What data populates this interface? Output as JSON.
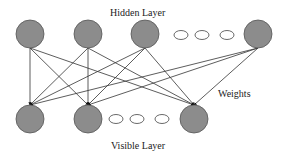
{
  "labels": {
    "hidden_layer": "Hidden Layer",
    "visible_layer": "Visible Layer",
    "weights": "Weights"
  },
  "colors": {
    "node_fill": "#8c8c8c",
    "node_stroke": "#555555",
    "edge": "#333333",
    "ellipsis_stroke": "#444444"
  },
  "hidden_nodes": [
    {
      "cx": 30,
      "cy": 34
    },
    {
      "cx": 88,
      "cy": 34
    },
    {
      "cx": 145,
      "cy": 34
    },
    {
      "cx": 258,
      "cy": 34
    }
  ],
  "hidden_ellipsis": [
    {
      "cx": 181,
      "cy": 35
    },
    {
      "cx": 202,
      "cy": 35
    },
    {
      "cx": 227,
      "cy": 35
    }
  ],
  "visible_nodes": [
    {
      "cx": 30,
      "cy": 119
    },
    {
      "cx": 88,
      "cy": 119
    },
    {
      "cx": 194,
      "cy": 119
    }
  ],
  "visible_ellipsis": [
    {
      "cx": 116,
      "cy": 119
    },
    {
      "cx": 137,
      "cy": 119
    },
    {
      "cx": 162,
      "cy": 119
    }
  ]
}
